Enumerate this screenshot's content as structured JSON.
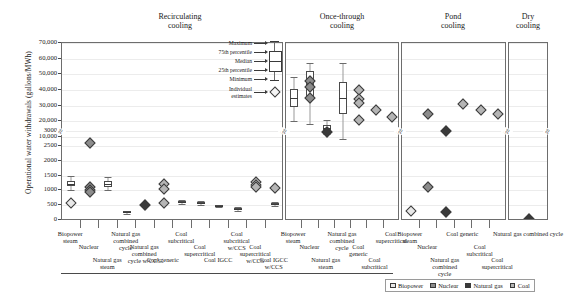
{
  "chart_data": {
    "type": "scatter",
    "title": "",
    "ylabel": "Operational water withdrawals (gallons/MWh)",
    "xlabel": "",
    "grid": true,
    "y_axis": {
      "broken": true,
      "lower_ticks": [
        0,
        500,
        1000,
        1500,
        2000,
        2500,
        3000
      ],
      "upper_ticks": [
        10000,
        20000,
        30000,
        40000,
        50000,
        60000,
        70000
      ],
      "tick_labels": [
        "0",
        "500",
        "1000",
        "1500",
        "2000",
        "2500",
        "3000",
        "10,000",
        "20,000",
        "30,000",
        "40,000",
        "50,000",
        "60,000",
        "70,000"
      ]
    },
    "legend": {
      "position": "bottom-right",
      "entries": [
        {
          "label": "Biopower",
          "color": "#e8e8e8"
        },
        {
          "label": "Nuclear",
          "color": "#8c8c8c"
        },
        {
          "label": "Natural gas",
          "color": "#3a3a3a"
        },
        {
          "label": "Coal",
          "color": "#b5b5b5"
        }
      ]
    },
    "boxplot_key": {
      "labels": [
        "Maximum",
        "75th percentile",
        "Median",
        "25th percentile",
        "Minimum"
      ],
      "individual_label_line1": "Individual",
      "individual_label_line2": "estimates"
    },
    "groups": [
      {
        "name": "Recirculating cooling",
        "categories": [
          "Biopower steam",
          "Nuclear",
          "Natural gas steam",
          "Natural gas combined cycle",
          "Natural gas combined cycle w/CCS",
          "Coal generic",
          "Coal subcritical",
          "Coal supercritical",
          "Coal IGCC",
          "Coal subcritical w/CCS",
          "Coal supercritical w/CCS",
          "Coal IGCC w/CCS"
        ],
        "series": [
          {
            "category": "Biopower steam",
            "fuel": "Biopower",
            "points": [
              {
                "value": 1230,
                "min": 1000,
                "max": 1470,
                "type": "box"
              },
              {
                "value": 560,
                "type": "individual"
              }
            ]
          },
          {
            "category": "Nuclear",
            "fuel": "Nuclear",
            "points": [
              {
                "value": 2600,
                "type": "individual"
              },
              {
                "value": 1100,
                "type": "individual"
              },
              {
                "value": 1000,
                "type": "individual"
              },
              {
                "value": 950,
                "type": "individual"
              }
            ]
          },
          {
            "category": "Natural gas steam",
            "fuel": "Natural gas",
            "points": [
              {
                "value": 1220,
                "min": 1010,
                "max": 1450,
                "type": "box"
              }
            ]
          },
          {
            "category": "Natural gas combined cycle",
            "fuel": "Natural gas",
            "points": [
              {
                "value": 255,
                "min": 210,
                "max": 300,
                "type": "box"
              }
            ]
          },
          {
            "category": "Natural gas combined cycle w/CCS",
            "fuel": "Natural gas",
            "points": [
              {
                "value": 510,
                "type": "individual"
              }
            ]
          },
          {
            "category": "Coal generic",
            "fuel": "Coal",
            "points": [
              {
                "value": 1230,
                "type": "individual"
              },
              {
                "value": 1040,
                "type": "individual"
              },
              {
                "value": 560,
                "type": "individual"
              }
            ]
          },
          {
            "category": "Coal subcritical",
            "fuel": "Coal",
            "points": [
              {
                "value": 610,
                "min": 540,
                "max": 690,
                "type": "box"
              }
            ]
          },
          {
            "category": "Coal supercritical",
            "fuel": "Coal",
            "points": [
              {
                "value": 580,
                "min": 520,
                "max": 650,
                "type": "box"
              }
            ]
          },
          {
            "category": "Coal IGCC",
            "fuel": "Coal",
            "points": [
              {
                "value": 470,
                "min": 430,
                "max": 520,
                "type": "box"
              }
            ]
          },
          {
            "category": "Coal subcritical w/CCS",
            "fuel": "Coal",
            "points": [
              {
                "value": 370,
                "min": 300,
                "max": 430,
                "type": "box"
              }
            ]
          },
          {
            "category": "Coal supercritical w/CCS",
            "fuel": "Coal",
            "points": [
              {
                "value": 1290,
                "type": "individual"
              },
              {
                "value": 1180,
                "type": "individual"
              },
              {
                "value": 1110,
                "type": "individual"
              }
            ]
          },
          {
            "category": "Coal IGCC w/CCS",
            "fuel": "Coal",
            "points": [
              {
                "value": 1080,
                "type": "individual"
              },
              {
                "value": 540,
                "min": 480,
                "max": 600,
                "type": "box"
              }
            ]
          }
        ]
      },
      {
        "name": "Once-through cooling",
        "categories": [
          "Biopower steam",
          "Nuclear",
          "Natural gas steam",
          "Natural gas combined cycle",
          "Coal generic",
          "Coal subcritical",
          "Coal supercritical"
        ],
        "series": [
          {
            "category": "Biopower steam",
            "fuel": "Biopower",
            "points": [
              {
                "value": 35000,
                "min": 20000,
                "max": 48000,
                "type": "box"
              }
            ]
          },
          {
            "category": "Nuclear",
            "fuel": "Nuclear",
            "points": [
              {
                "value": 44000,
                "min": 18000,
                "max": 57000,
                "type": "box"
              },
              {
                "value": 46000,
                "type": "individual"
              },
              {
                "value": 42000,
                "type": "individual"
              },
              {
                "value": 35000,
                "type": "individual"
              }
            ]
          },
          {
            "category": "Natural gas steam",
            "fuel": "Natural gas",
            "points": [
              {
                "value": 16000,
                "min": 12000,
                "max": 21000,
                "type": "box"
              },
              {
                "value": 13000,
                "type": "individual"
              }
            ]
          },
          {
            "category": "Natural gas combined cycle",
            "fuel": "Natural gas",
            "points": [
              {
                "value": 35000,
                "min": 9000,
                "max": 57000,
                "type": "box"
              }
            ]
          },
          {
            "category": "Coal generic",
            "fuel": "Coal",
            "points": [
              {
                "value": 40000,
                "type": "individual"
              },
              {
                "value": 34000,
                "type": "individual"
              },
              {
                "value": 32000,
                "type": "individual"
              },
              {
                "value": 21000,
                "type": "individual"
              }
            ]
          },
          {
            "category": "Coal subcritical",
            "fuel": "Coal",
            "points": [
              {
                "value": 27000,
                "type": "individual"
              }
            ]
          },
          {
            "category": "Coal supercritical",
            "fuel": "Coal",
            "points": [
              {
                "value": 23000,
                "type": "individual"
              }
            ]
          }
        ]
      },
      {
        "name": "Pond cooling",
        "categories": [
          "Biopower steam",
          "Nuclear",
          "Natural gas combined cycle",
          "Coal generic",
          "Coal subcritical",
          "Coal supercritical"
        ],
        "series": [
          {
            "category": "Biopower steam",
            "fuel": "Biopower",
            "points": [
              {
                "value": 300,
                "type": "individual"
              }
            ]
          },
          {
            "category": "Nuclear",
            "fuel": "Nuclear",
            "points": [
              {
                "value": 25000,
                "type": "individual"
              },
              {
                "value": 1100,
                "type": "individual"
              }
            ]
          },
          {
            "category": "Natural gas combined cycle",
            "fuel": "Natural gas",
            "points": [
              {
                "value": 14000,
                "type": "individual"
              },
              {
                "value": 280,
                "type": "individual"
              }
            ]
          },
          {
            "category": "Coal generic",
            "fuel": "Coal",
            "points": [
              {
                "value": 31000,
                "type": "individual"
              }
            ]
          },
          {
            "category": "Coal subcritical",
            "fuel": "Coal",
            "points": [
              {
                "value": 27000,
                "type": "individual"
              }
            ]
          },
          {
            "category": "Coal supercritical",
            "fuel": "Coal",
            "points": [
              {
                "value": 25000,
                "type": "individual"
              }
            ]
          }
        ]
      },
      {
        "name": "Dry cooling",
        "categories": [
          "Natural gas combined cycle"
        ],
        "series": [
          {
            "category": "Natural gas combined cycle",
            "fuel": "Natural gas",
            "points": [
              {
                "value": 20,
                "type": "individual"
              }
            ]
          }
        ]
      }
    ]
  }
}
